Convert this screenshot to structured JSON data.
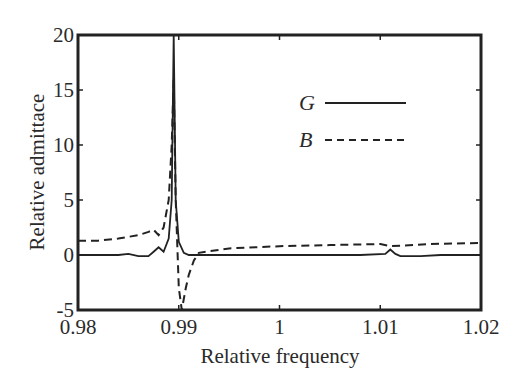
{
  "chart_data": {
    "type": "line",
    "title": "",
    "xlabel": "Relative frequency",
    "ylabel": "Relative admittace",
    "xlim": [
      0.98,
      1.02
    ],
    "ylim": [
      -5,
      20
    ],
    "xticks": [
      0.98,
      0.99,
      1,
      1.01,
      1.02
    ],
    "xtick_labels": [
      "0.98",
      "0.99",
      "1",
      "1.01",
      "1.02"
    ],
    "yticks": [
      -5,
      0,
      5,
      10,
      15,
      20
    ],
    "ytick_labels": [
      "-5",
      "0",
      "5",
      "10",
      "15",
      "20"
    ],
    "grid": false,
    "legend_position": "upper right (inside)",
    "series": [
      {
        "name": "G",
        "style": "solid",
        "x": [
          0.98,
          0.984,
          0.985,
          0.986,
          0.987,
          0.9875,
          0.988,
          0.9885,
          0.989,
          0.9893,
          0.9895,
          0.9897,
          0.99,
          0.9905,
          0.991,
          0.995,
          1.0,
          1.005,
          1.008,
          1.0105,
          1.011,
          1.0115,
          1.012,
          1.014,
          1.016,
          1.02
        ],
        "y": [
          0,
          0,
          0.1,
          -0.1,
          -0.1,
          0.3,
          0.7,
          0.3,
          1.5,
          5,
          20,
          5,
          1.2,
          0.2,
          0,
          0,
          0,
          0,
          0,
          0.1,
          0.5,
          0.1,
          -0.1,
          -0.1,
          0,
          0
        ]
      },
      {
        "name": "B",
        "style": "dashed",
        "x": [
          0.98,
          0.982,
          0.984,
          0.986,
          0.987,
          0.9875,
          0.988,
          0.9885,
          0.989,
          0.9893,
          0.9895,
          0.9897,
          0.99,
          0.9903,
          0.9907,
          0.991,
          0.9915,
          0.992,
          0.995,
          1.0,
          1.005,
          1.01,
          1.011,
          1.015,
          1.02
        ],
        "y": [
          1.3,
          1.3,
          1.5,
          1.8,
          2.1,
          2.3,
          1.8,
          2.5,
          5,
          10,
          16,
          5,
          -3,
          -5,
          -3,
          -1.8,
          -0.5,
          0.2,
          0.6,
          0.8,
          0.9,
          1.0,
          0.8,
          1.0,
          1.1
        ]
      }
    ],
    "legend": [
      {
        "label": "G",
        "style": "solid"
      },
      {
        "label": "B",
        "style": "dashed"
      }
    ]
  }
}
